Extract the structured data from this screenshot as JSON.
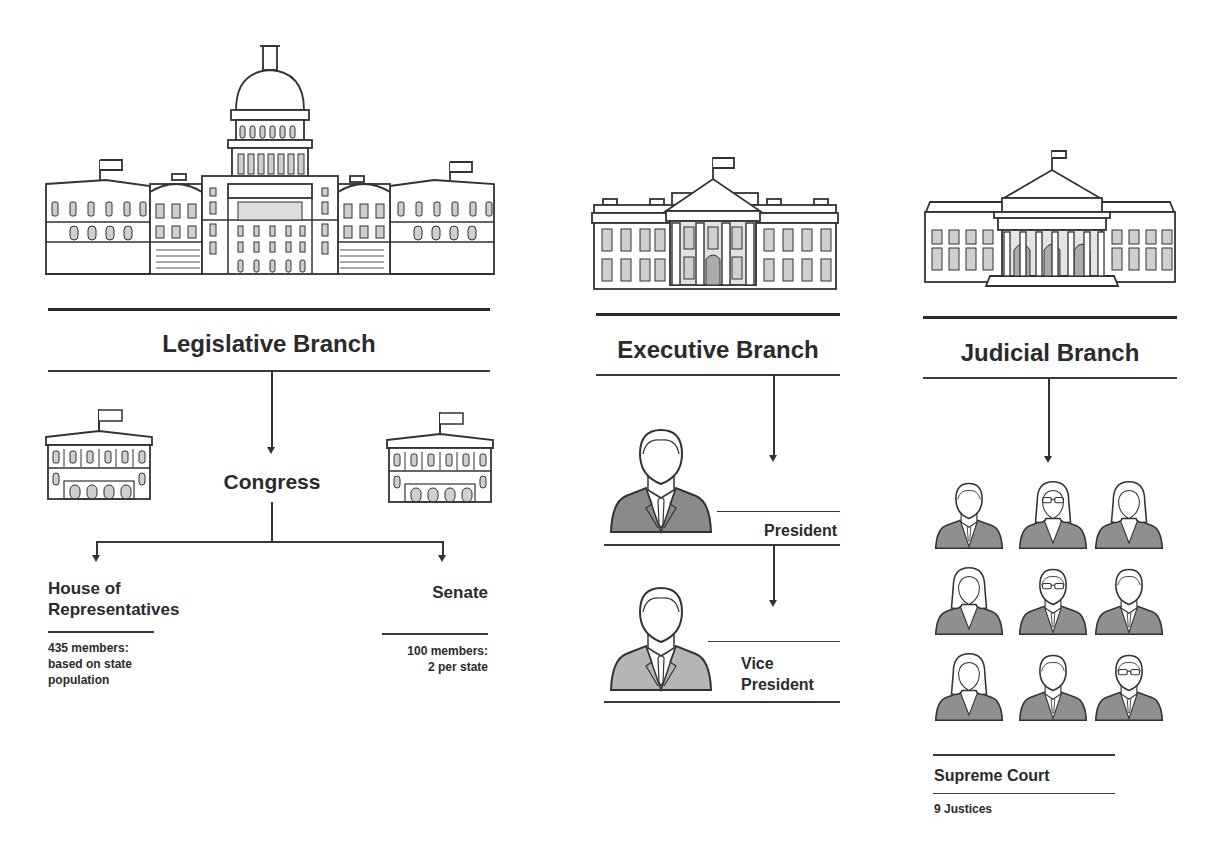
{
  "legislative": {
    "title": "Legislative Branch",
    "body": "Congress",
    "house": {
      "name_line1": "House of",
      "name_line2": "Representatives",
      "detail_line1": "435 members:",
      "detail_line2": "based on state",
      "detail_line3": "population"
    },
    "senate": {
      "name": "Senate",
      "detail_line1": "100 members:",
      "detail_line2": "2 per state"
    },
    "icons": [
      "capitol-building-icon",
      "house-chamber-building-icon",
      "senate-chamber-building-icon"
    ]
  },
  "executive": {
    "title": "Executive Branch",
    "president": "President",
    "vice_president_line1": "Vice",
    "vice_president_line2": "President",
    "icons": [
      "white-house-icon",
      "president-person-icon",
      "vice-president-person-icon"
    ]
  },
  "judicial": {
    "title": "Judicial Branch",
    "court": "Supreme Court",
    "justices": "9 Justices",
    "justice_count": 9,
    "icons": [
      "supreme-court-building-icon",
      "justice-person-icon"
    ]
  },
  "colors": {
    "line": "#333333",
    "text": "#2b2b2b",
    "suit_dark": "#8a8a8a",
    "suit_light": "#b5b5b5",
    "window_fill": "#cfcfcf"
  }
}
